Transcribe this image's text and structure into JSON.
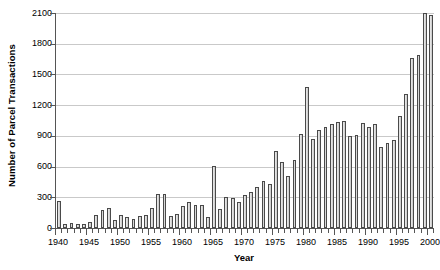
{
  "chart_data": {
    "type": "bar",
    "title": "",
    "subtitle": "",
    "xlabel": "Year",
    "ylabel": "Number of Parcel Transactions",
    "xlim": [
      1939.5,
      2000.5
    ],
    "ylim": [
      0,
      2100
    ],
    "ytick_step": 300,
    "yticks": [
      0,
      300,
      600,
      900,
      1200,
      1500,
      1800,
      2100
    ],
    "ytick_labels": [
      "0",
      "300",
      "600",
      "900",
      "1200",
      "1500",
      "1800",
      "2100"
    ],
    "xticks_labeled": [
      1940,
      1945,
      1950,
      1955,
      1960,
      1965,
      1970,
      1975,
      1980,
      1985,
      1990,
      1995,
      2000
    ],
    "xtick_labels": [
      "1940",
      "1945",
      "1950",
      "1955",
      "1960",
      "1965",
      "1970",
      "1975",
      "1980",
      "1985",
      "1990",
      "1995",
      "2000"
    ],
    "grid": "horizontal",
    "legend": "none",
    "bar_fill_color": "#dcdcdc",
    "bar_edge_color": "#4a4a4a",
    "gridline_color": "#c9c9c9",
    "axis_color": "#555555",
    "categories": [
      "1940",
      "1941",
      "1942",
      "1943",
      "1944",
      "1945",
      "1946",
      "1947",
      "1948",
      "1949",
      "1950",
      "1951",
      "1952",
      "1953",
      "1954",
      "1955",
      "1956",
      "1957",
      "1958",
      "1959",
      "1960",
      "1961",
      "1962",
      "1963",
      "1964",
      "1965",
      "1966",
      "1967",
      "1968",
      "1969",
      "1970",
      "1971",
      "1972",
      "1973",
      "1974",
      "1975",
      "1976",
      "1977",
      "1978",
      "1979",
      "1980",
      "1981",
      "1982",
      "1983",
      "1984",
      "1985",
      "1986",
      "1987",
      "1988",
      "1989",
      "1990",
      "1991",
      "1992",
      "1993",
      "1994",
      "1995",
      "1996",
      "1997",
      "1998",
      "1999",
      "2000"
    ],
    "values": [
      265,
      40,
      45,
      35,
      40,
      55,
      130,
      175,
      200,
      75,
      125,
      110,
      85,
      120,
      130,
      195,
      335,
      330,
      115,
      140,
      215,
      250,
      220,
      225,
      110,
      610,
      185,
      305,
      290,
      255,
      320,
      355,
      400,
      455,
      430,
      750,
      640,
      505,
      660,
      915,
      1375,
      870,
      955,
      985,
      1015,
      1040,
      1050,
      900,
      905,
      1030,
      990,
      1015,
      790,
      830,
      860,
      1090,
      1310,
      1660,
      1690,
      2100,
      2080
    ]
  },
  "axes": {
    "y_title": "Number of Parcel Transactions",
    "x_title": "Year"
  }
}
